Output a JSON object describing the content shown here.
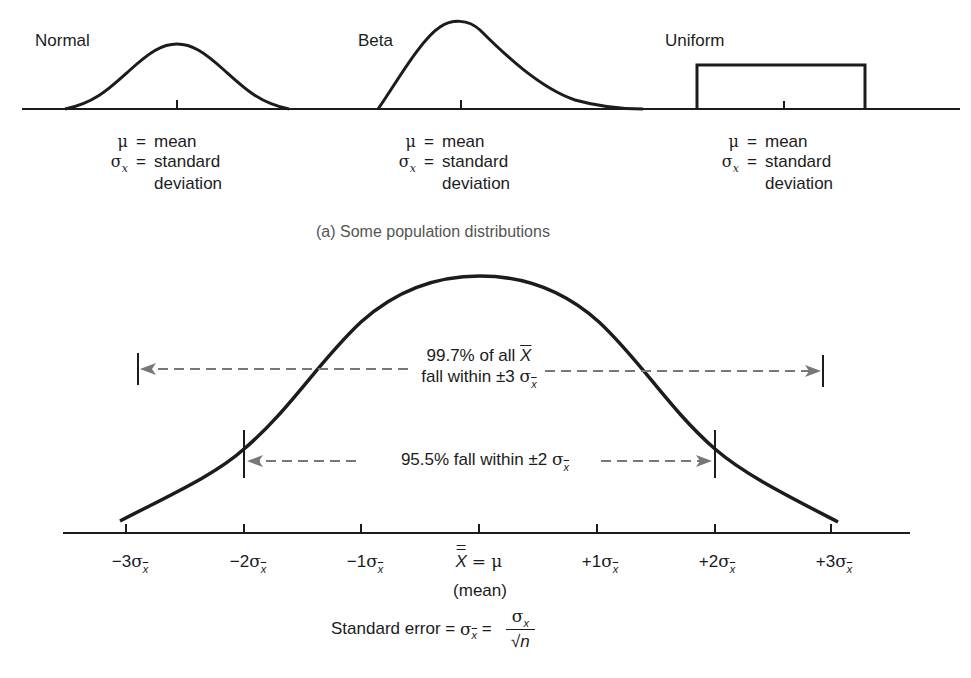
{
  "figure": {
    "part_a": {
      "caption": "(a) Some population distributions",
      "distributions": [
        {
          "name": "Normal",
          "shape": "symmetric bell",
          "legend": [
            {
              "symbol": "μ",
              "sub": "",
              "eq": "=",
              "text": "mean"
            },
            {
              "symbol": "σ",
              "sub": "x",
              "eq": "=",
              "text": "standard"
            },
            {
              "symbol": "",
              "sub": "",
              "eq": "",
              "text": "deviation"
            }
          ]
        },
        {
          "name": "Beta",
          "shape": "right-skewed",
          "legend": [
            {
              "symbol": "μ",
              "sub": "",
              "eq": "=",
              "text": "mean"
            },
            {
              "symbol": "σ",
              "sub": "x",
              "eq": "=",
              "text": "standard"
            },
            {
              "symbol": "",
              "sub": "",
              "eq": "",
              "text": "deviation"
            }
          ]
        },
        {
          "name": "Uniform",
          "shape": "rectangle",
          "legend": [
            {
              "symbol": "μ",
              "sub": "",
              "eq": "=",
              "text": "mean"
            },
            {
              "symbol": "σ",
              "sub": "x",
              "eq": "=",
              "text": "standard"
            },
            {
              "symbol": "",
              "sub": "",
              "eq": "",
              "text": "deviation"
            }
          ]
        }
      ]
    },
    "part_b": {
      "annotation_997": {
        "line1": "99.7% of all",
        "xbar": "X",
        "line2": "fall within ±3",
        "sigma": "σ",
        "sub": "x"
      },
      "annotation_955": {
        "text": "95.5% fall within ±2",
        "sigma": "σ",
        "sub": "x"
      },
      "axis_ticks": [
        {
          "prefix": "−3",
          "sigma": "σ",
          "sub": "x"
        },
        {
          "prefix": "−2",
          "sigma": "σ",
          "sub": "x"
        },
        {
          "prefix": "−1",
          "sigma": "σ",
          "sub": "x"
        },
        {
          "prefix": "",
          "sigma": "",
          "sub": "",
          "center": true
        },
        {
          "prefix": "+1",
          "sigma": "σ",
          "sub": "x"
        },
        {
          "prefix": "+2",
          "sigma": "σ",
          "sub": "x"
        },
        {
          "prefix": "+3",
          "sigma": "σ",
          "sub": "x"
        }
      ],
      "center_label": {
        "xbar": "X",
        "eq": "= μ",
        "note": "(mean)"
      },
      "formula": {
        "label": "Standard error =",
        "sigma": "σ",
        "sub": "x",
        "eq": "=",
        "num_sigma": "σ",
        "num_sub": "x",
        "den": "√n"
      }
    }
  }
}
